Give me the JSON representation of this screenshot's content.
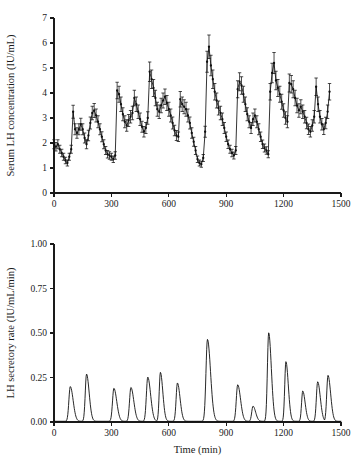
{
  "figure": {
    "background_color": "#ffffff",
    "ink_color": "#101010"
  },
  "chart_data": [
    {
      "type": "line",
      "panel": "top",
      "title": "",
      "xlabel": "",
      "ylabel": "Serum LH concentration (IU/mL)",
      "xlim": [
        0,
        1500
      ],
      "ylim": [
        0,
        7
      ],
      "xticks": [
        0,
        300,
        600,
        900,
        1200,
        1500
      ],
      "yticks": [
        0,
        1,
        2,
        3,
        4,
        5,
        6,
        7
      ],
      "xtick_labels": [
        "0",
        "300",
        "600",
        "900",
        "1200",
        "1500"
      ],
      "ytick_labels": [
        "0",
        "1",
        "2",
        "3",
        "4",
        "5",
        "6",
        "7"
      ],
      "grid": false,
      "legend": null,
      "error_bars": true,
      "marker": "filled-circle",
      "sampling_interval_min": 10,
      "x": [
        0,
        10,
        20,
        30,
        40,
        50,
        60,
        70,
        80,
        90,
        100,
        110,
        120,
        130,
        140,
        150,
        160,
        170,
        180,
        190,
        200,
        210,
        220,
        230,
        240,
        250,
        260,
        270,
        280,
        290,
        300,
        310,
        320,
        330,
        340,
        350,
        360,
        370,
        380,
        390,
        400,
        410,
        420,
        430,
        440,
        450,
        460,
        470,
        480,
        490,
        500,
        510,
        520,
        530,
        540,
        550,
        560,
        570,
        580,
        590,
        600,
        610,
        620,
        630,
        640,
        650,
        660,
        670,
        680,
        690,
        700,
        710,
        720,
        730,
        740,
        750,
        760,
        770,
        780,
        790,
        800,
        810,
        820,
        830,
        840,
        850,
        860,
        870,
        880,
        890,
        900,
        910,
        920,
        930,
        940,
        950,
        960,
        970,
        980,
        990,
        1000,
        1010,
        1020,
        1030,
        1040,
        1050,
        1060,
        1070,
        1080,
        1090,
        1100,
        1110,
        1120,
        1130,
        1140,
        1150,
        1160,
        1170,
        1180,
        1190,
        1200,
        1210,
        1220,
        1230,
        1240,
        1250,
        1260,
        1270,
        1280,
        1290,
        1300,
        1310,
        1320,
        1330,
        1340,
        1350,
        1360,
        1370,
        1380,
        1390,
        1400,
        1410,
        1420,
        1430,
        1440
      ],
      "y": [
        1.95,
        1.85,
        1.95,
        1.75,
        1.6,
        1.45,
        1.3,
        1.2,
        1.45,
        1.75,
        3.25,
        2.55,
        2.4,
        2.55,
        2.75,
        2.55,
        2.2,
        1.95,
        2.3,
        2.8,
        3.2,
        3.3,
        3.1,
        2.85,
        2.55,
        2.25,
        1.95,
        1.7,
        1.55,
        1.5,
        1.45,
        1.35,
        1.5,
        4.1,
        3.95,
        3.55,
        3.15,
        2.85,
        2.7,
        2.9,
        3.05,
        3.2,
        3.8,
        3.55,
        3.25,
        2.95,
        2.65,
        2.45,
        2.6,
        3.0,
        4.85,
        4.55,
        4.2,
        3.8,
        3.35,
        3.25,
        3.5,
        3.7,
        3.85,
        3.6,
        3.35,
        3.1,
        2.8,
        2.5,
        2.3,
        2.25,
        3.75,
        3.55,
        3.45,
        3.35,
        3.1,
        2.8,
        2.4,
        2.05,
        1.7,
        1.35,
        1.2,
        1.15,
        1.4,
        2.45,
        5.25,
        5.85,
        5.1,
        4.55,
        4.05,
        3.7,
        3.4,
        3.2,
        2.95,
        2.6,
        2.25,
        1.95,
        1.75,
        1.6,
        1.5,
        1.7,
        4.15,
        4.45,
        4.3,
        3.95,
        3.55,
        3.15,
        2.85,
        2.6,
        2.95,
        3.1,
        2.85,
        2.55,
        2.25,
        1.95,
        1.8,
        1.7,
        1.55,
        4.05,
        4.8,
        5.2,
        4.5,
        4.2,
        3.95,
        3.65,
        3.3,
        3.0,
        2.85,
        4.4,
        4.35,
        4.15,
        3.8,
        3.5,
        3.3,
        3.45,
        3.25,
        3.05,
        2.8,
        2.55,
        2.45,
        2.7,
        3.05,
        4.25,
        3.55,
        3.05,
        2.75,
        2.55,
        2.8,
        3.25,
        4.05,
        3.3
      ],
      "yerr": [
        0.18,
        0.17,
        0.18,
        0.16,
        0.15,
        0.14,
        0.13,
        0.12,
        0.14,
        0.16,
        0.26,
        0.22,
        0.21,
        0.22,
        0.24,
        0.22,
        0.2,
        0.18,
        0.21,
        0.24,
        0.27,
        0.28,
        0.26,
        0.24,
        0.22,
        0.2,
        0.18,
        0.16,
        0.15,
        0.15,
        0.14,
        0.13,
        0.15,
        0.33,
        0.32,
        0.29,
        0.26,
        0.24,
        0.23,
        0.24,
        0.25,
        0.27,
        0.31,
        0.29,
        0.27,
        0.25,
        0.22,
        0.21,
        0.22,
        0.25,
        0.39,
        0.37,
        0.34,
        0.31,
        0.28,
        0.27,
        0.29,
        0.3,
        0.31,
        0.3,
        0.28,
        0.26,
        0.24,
        0.21,
        0.2,
        0.19,
        0.31,
        0.29,
        0.28,
        0.28,
        0.26,
        0.24,
        0.21,
        0.18,
        0.16,
        0.13,
        0.12,
        0.12,
        0.14,
        0.22,
        0.42,
        0.47,
        0.41,
        0.37,
        0.33,
        0.3,
        0.28,
        0.27,
        0.25,
        0.22,
        0.19,
        0.17,
        0.16,
        0.15,
        0.14,
        0.16,
        0.34,
        0.36,
        0.35,
        0.32,
        0.29,
        0.26,
        0.24,
        0.22,
        0.25,
        0.26,
        0.24,
        0.22,
        0.19,
        0.17,
        0.16,
        0.15,
        0.14,
        0.33,
        0.39,
        0.42,
        0.37,
        0.34,
        0.32,
        0.3,
        0.27,
        0.25,
        0.24,
        0.36,
        0.35,
        0.34,
        0.31,
        0.29,
        0.27,
        0.28,
        0.27,
        0.25,
        0.23,
        0.21,
        0.21,
        0.23,
        0.25,
        0.35,
        0.29,
        0.25,
        0.23,
        0.21,
        0.23,
        0.27,
        0.33,
        0.27
      ]
    },
    {
      "type": "line",
      "panel": "bottom",
      "title": "",
      "xlabel": "Time (min)",
      "ylabel": "LH secretory rate (IU/mL/min)",
      "xlim": [
        0,
        1500
      ],
      "ylim": [
        0,
        1.0
      ],
      "xticks": [
        0,
        300,
        600,
        900,
        1200,
        1500
      ],
      "yticks": [
        0.0,
        0.25,
        0.5,
        0.75,
        1.0
      ],
      "xtick_labels": [
        "0",
        "300",
        "600",
        "900",
        "1200",
        "1500"
      ],
      "ytick_labels": [
        "0.00",
        "0.25",
        "0.50",
        "0.75",
        "1.00"
      ],
      "grid": false,
      "legend": null,
      "basal_rate": 0.004,
      "pulses": [
        {
          "time": 85,
          "amplitude": 0.195,
          "width": 13
        },
        {
          "time": 170,
          "amplitude": 0.265,
          "width": 12
        },
        {
          "time": 313,
          "amplitude": 0.185,
          "width": 13
        },
        {
          "time": 402,
          "amplitude": 0.19,
          "width": 13
        },
        {
          "time": 490,
          "amplitude": 0.248,
          "width": 13
        },
        {
          "time": 556,
          "amplitude": 0.275,
          "width": 11
        },
        {
          "time": 645,
          "amplitude": 0.215,
          "width": 12
        },
        {
          "time": 802,
          "amplitude": 0.46,
          "width": 14
        },
        {
          "time": 960,
          "amplitude": 0.205,
          "width": 13
        },
        {
          "time": 1040,
          "amplitude": 0.085,
          "width": 12
        },
        {
          "time": 1122,
          "amplitude": 0.497,
          "width": 12
        },
        {
          "time": 1212,
          "amplitude": 0.335,
          "width": 11
        },
        {
          "time": 1300,
          "amplitude": 0.17,
          "width": 11
        },
        {
          "time": 1378,
          "amplitude": 0.222,
          "width": 12
        },
        {
          "time": 1432,
          "amplitude": 0.258,
          "width": 12
        }
      ]
    }
  ]
}
